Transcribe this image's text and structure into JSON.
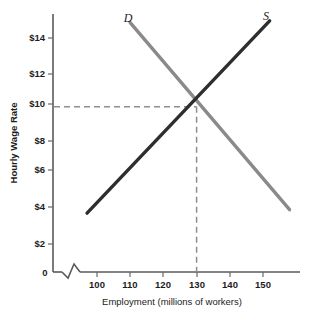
{
  "chart_data": {
    "type": "line",
    "title": "",
    "xlabel": "Employment (millions of workers)",
    "ylabel": "Hourly Wage Rate",
    "xlim": [
      95,
      160
    ],
    "ylim": [
      0,
      15.5
    ],
    "xticks": [
      "100",
      "110",
      "120",
      "130",
      "140",
      "150"
    ],
    "xtick_values": [
      100,
      110,
      120,
      130,
      140,
      150
    ],
    "yticks": [
      "$2",
      "$4",
      "$6",
      "$8",
      "$10",
      "$12",
      "$14"
    ],
    "ytick_values": [
      2,
      4,
      6,
      8,
      10,
      12,
      14
    ],
    "origin_label": "0",
    "axis_break": true,
    "grid": false,
    "legend": "inline-curve-labels",
    "series": [
      {
        "name": "D",
        "label": "D",
        "role": "demand",
        "color": "#8a8a8a",
        "x": [
          110,
          158
        ],
        "y": [
          14.9,
          4.0
        ],
        "points": [
          {
            "x": 110,
            "y": 14.9
          },
          {
            "x": 130,
            "y": 10.0
          },
          {
            "x": 158,
            "y": 4.0
          }
        ]
      },
      {
        "name": "S",
        "label": "S",
        "role": "supply",
        "color": "#2e2e2e",
        "x": [
          97,
          152
        ],
        "y": [
          3.8,
          15.0
        ],
        "points": [
          {
            "x": 97,
            "y": 3.8
          },
          {
            "x": 130,
            "y": 10.0
          },
          {
            "x": 152,
            "y": 15.0
          }
        ]
      }
    ],
    "equilibrium": {
      "x": 130,
      "y": 10,
      "wage_label": "$10",
      "employment_label": "130",
      "guides": "dashed"
    },
    "annotations": [
      {
        "text": "D",
        "x": 110,
        "y": 15.4
      },
      {
        "text": "S",
        "x": 152,
        "y": 15.4
      }
    ]
  },
  "colors": {
    "demand": "#8a8a8a",
    "supply": "#2e2e2e",
    "axis": "#5a5a5a",
    "guide": "#8e8e8e",
    "text": "#1c1c1c",
    "background": "#ffffff"
  }
}
